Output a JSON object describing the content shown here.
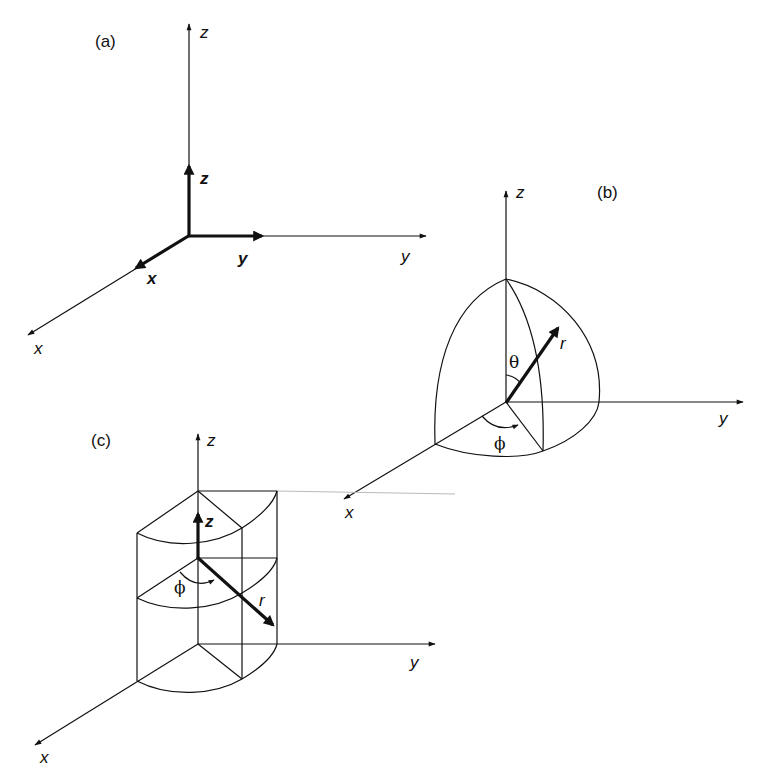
{
  "figure": {
    "panels": [
      {
        "id": "a",
        "label": "(a)",
        "axes": {
          "x": "x",
          "y": "y",
          "z": "z"
        },
        "unit_vectors": {
          "x": "x",
          "y": "y",
          "z": "z"
        }
      },
      {
        "id": "b",
        "label": "(b)",
        "axes": {
          "x": "x",
          "y": "y",
          "z": "z"
        },
        "variables": {
          "r": "r",
          "theta": "θ",
          "phi": "ϕ"
        }
      },
      {
        "id": "c",
        "label": "(c)",
        "axes": {
          "x": "x",
          "y": "y",
          "z": "z"
        },
        "variables": {
          "r": "r",
          "z": "z",
          "phi": "ϕ"
        }
      }
    ]
  },
  "colors": {
    "stroke": "#111111",
    "background": "#ffffff"
  }
}
